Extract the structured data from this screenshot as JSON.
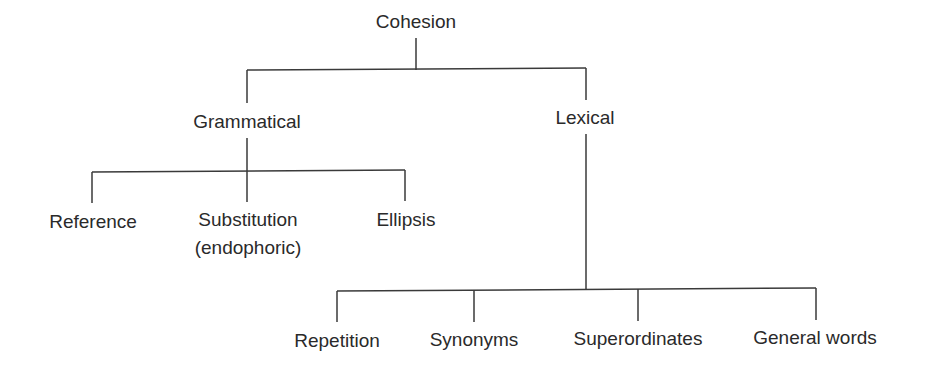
{
  "diagram": {
    "type": "tree",
    "root": {
      "label": "Cohesion",
      "children": [
        {
          "label": "Grammatical",
          "children": [
            {
              "label": "Reference"
            },
            {
              "label": "Substitution",
              "sublabel": "(endophoric)"
            },
            {
              "label": "Ellipsis"
            }
          ]
        },
        {
          "label": "Lexical",
          "children": [
            {
              "label": "Repetition"
            },
            {
              "label": "Synonyms"
            },
            {
              "label": "Superordinates"
            },
            {
              "label": "General words"
            }
          ]
        }
      ]
    },
    "line_color": "#3a3a3a"
  }
}
